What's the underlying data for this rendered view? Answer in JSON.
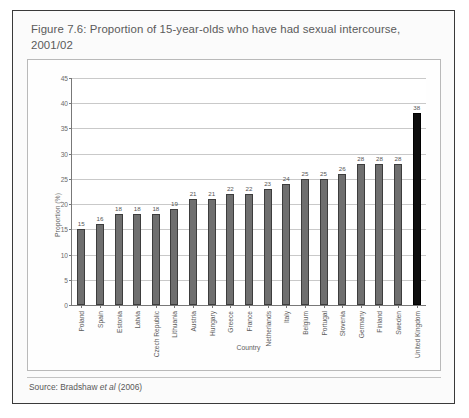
{
  "figure": {
    "title": "Figure 7.6: Proportion of 15-year-olds  who have had sexual intercourse, 2001/02",
    "source_prefix": "Source: Bradshaw ",
    "source_italic": "et al",
    "source_suffix": " (2006)"
  },
  "colors": {
    "bar": "#6f6f6f",
    "bar_highlight": "#0d0d0d",
    "frame": "#3a3a3a",
    "grid": "#c9c9c9",
    "axis": "#787878",
    "title_text": "#5a5a5a"
  },
  "chart_data": {
    "type": "bar",
    "title": "Figure 7.6: Proportion of 15-year-olds  who have had sexual intercourse, 2001/02",
    "xlabel": "Country",
    "ylabel": "Proportion (%)",
    "ylim": [
      0,
      45
    ],
    "yticks": [
      0,
      5,
      10,
      15,
      20,
      25,
      30,
      35,
      40,
      45
    ],
    "grid": true,
    "legend": "none",
    "highlight_category": "United Kingdom",
    "categories": [
      "Poland",
      "Spain",
      "Estonia",
      "Latvia",
      "Czech Republic",
      "Lithuania",
      "Austria",
      "Hungary",
      "Greece",
      "France",
      "Netherlands",
      "Italy",
      "Belgium",
      "Portugal",
      "Slovenia",
      "Germany",
      "Finland",
      "Sweden",
      "United Kingdom"
    ],
    "values": [
      15,
      16,
      18,
      18,
      18,
      19,
      21,
      21,
      22,
      22,
      23,
      24,
      25,
      25,
      26,
      28,
      28,
      28,
      38
    ],
    "data_labels": [
      "15",
      "16",
      "18",
      "18",
      "18",
      "19",
      "21",
      "21",
      "22",
      "22",
      "23",
      "24",
      "25",
      "25",
      "26",
      "28",
      "28",
      "28",
      "38"
    ]
  }
}
